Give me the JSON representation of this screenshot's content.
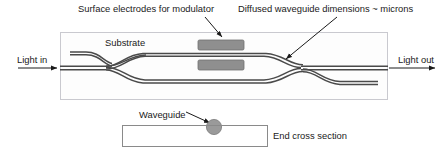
{
  "figure": {
    "title_labels": {
      "surface_electrodes": "Surface electrodes for modulator",
      "diffused_dimensions": "Diffused waveguide dimensions ~ microns",
      "substrate": "Substrate",
      "light_in": "Light in",
      "light_out": "Light out",
      "waveguide": "Waveguide",
      "end_cross_section": "End cross section"
    },
    "colors": {
      "substrate_border": "#c9c9cf",
      "substrate_fill": "#fdfdfd",
      "waveguide_line": "#4a4a4a",
      "electrode_fill": "#8f8f8f",
      "electrode_border": "#6e6e6e",
      "arrow": "#1a1a1a",
      "text": "#1a1a1a",
      "cross_section_border": "#8a8a8a",
      "cross_waveguide_fill": "#9a9a9a"
    },
    "geometry": {
      "substrate_box": {
        "x": 60,
        "y": 32,
        "width": 328,
        "height": 68
      },
      "cross_section_box": {
        "x": 122,
        "y": 125,
        "width": 146,
        "height": 22
      },
      "cross_waveguide": {
        "cx": 214,
        "cy": 126,
        "r": 8
      },
      "input_axis_y": 68,
      "upper_arm_y": 55,
      "lower_arm_y": 82,
      "split_x": 105,
      "combine_x": 292,
      "electrode_upper": {
        "x": 198,
        "y": 40,
        "width": 46,
        "height": 10
      },
      "electrode_lower": {
        "x": 198,
        "y": 60,
        "width": 46,
        "height": 10
      }
    },
    "annotations": [
      {
        "name": "electrode-pointer",
        "from": [
          205,
          17
        ],
        "to": [
          223,
          38
        ]
      },
      {
        "name": "dimension-pointer",
        "from": [
          337,
          17
        ],
        "to": [
          285,
          60
        ]
      },
      {
        "name": "waveguide-pointer",
        "from": [
          186,
          113
        ],
        "to": [
          211,
          124
        ]
      },
      {
        "name": "light-in-arrow",
        "from": [
          18,
          68
        ],
        "to": [
          59,
          68
        ]
      },
      {
        "name": "light-out-arrow",
        "from": [
          389,
          68
        ],
        "to": [
          436,
          68
        ]
      }
    ]
  }
}
